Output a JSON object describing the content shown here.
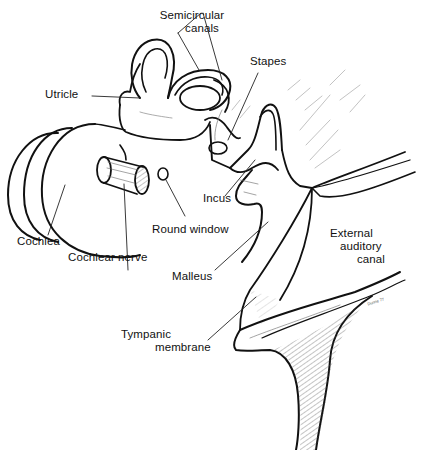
{
  "figure": {
    "style": "black ink line drawing on white",
    "colors": {
      "ink": "#111111",
      "background": "#ffffff",
      "hatch": "#444444"
    }
  },
  "labels": {
    "semicircular_canals": {
      "line1": "Semicircular",
      "line2": "canals"
    },
    "stapes": "Stapes",
    "utricle": "Utricle",
    "incus": "Incus",
    "round_window": "Round window",
    "cochlea": "Cochlea",
    "cochlear_nerve": "Cochlear nerve",
    "external_auditory_canal": {
      "line1": "External",
      "line2": "auditory",
      "line3": "canal"
    },
    "malleus": "Malleus",
    "tympanic_membrane": {
      "line1": "Tympanic",
      "line2": "membrane"
    }
  },
  "signature": "Dunne 77"
}
